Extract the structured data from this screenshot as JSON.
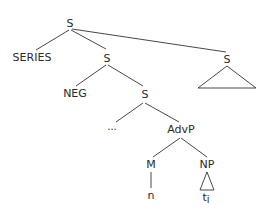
{
  "diagram": {
    "type": "syntax-tree",
    "nodes": {
      "root": {
        "label": "S"
      },
      "series": {
        "label": "SERIES"
      },
      "s2": {
        "label": "S"
      },
      "s_right": {
        "label": "S"
      },
      "neg": {
        "label": "NEG"
      },
      "s3": {
        "label": "S"
      },
      "ellipsis": {
        "label": "..."
      },
      "advp": {
        "label": "AdvP"
      },
      "m": {
        "label": "M"
      },
      "np": {
        "label": "NP"
      },
      "n": {
        "label": "n"
      },
      "trace": {
        "label": "t",
        "subscript": "i"
      }
    },
    "edges": [
      [
        "root",
        "series"
      ],
      [
        "root",
        "s2"
      ],
      [
        "root",
        "s_right"
      ],
      [
        "s2",
        "neg"
      ],
      [
        "s2",
        "s3"
      ],
      [
        "s3",
        "ellipsis"
      ],
      [
        "s3",
        "advp"
      ],
      [
        "advp",
        "m"
      ],
      [
        "advp",
        "np"
      ],
      [
        "m",
        "n"
      ],
      [
        "np",
        "trace"
      ]
    ],
    "triangles": [
      "s_right",
      "np"
    ]
  }
}
